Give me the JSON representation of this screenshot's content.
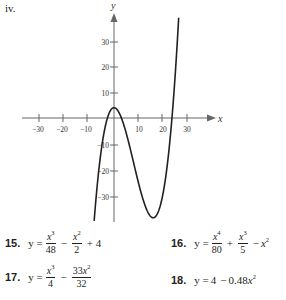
{
  "panel_label": "iv.",
  "chart_data": {
    "type": "line",
    "title": "",
    "xlabel": "x",
    "ylabel": "y",
    "x_ticks": [
      -30,
      -20,
      -10,
      10,
      20,
      30
    ],
    "y_ticks": [
      -30,
      -20,
      -10,
      10,
      20,
      30
    ],
    "x_tick_labels": [
      "−30",
      "−20",
      "−10",
      "10",
      "20",
      "30"
    ],
    "y_tick_labels": [
      "30",
      "20",
      "10",
      "−10",
      "−20",
      "−30"
    ],
    "xlim": [
      -36,
      36
    ],
    "ylim": [
      -38,
      40
    ],
    "grid": false,
    "series": [
      {
        "name": "curve",
        "function": "y = x^3/48 - x^2/2 + 4",
        "key_points": {
          "local_max": [
            0,
            4
          ],
          "local_min": [
            16,
            -38.7
          ],
          "x_intercepts": [
            -2.7,
            3.1,
            23.7
          ]
        }
      }
    ]
  },
  "axis": {
    "x_name": "x",
    "y_name": "y"
  },
  "exercises": [
    {
      "number": "15.",
      "lhs": "y =",
      "parts": [
        "x3/48",
        "x2/2",
        "+ 4"
      ]
    },
    {
      "number": "16.",
      "lhs": "y =",
      "parts": [
        "x4/80",
        "x3/5",
        "− x2"
      ]
    },
    {
      "number": "17.",
      "lhs": "y =",
      "parts": [
        "x3/4",
        "33x2/32"
      ]
    },
    {
      "number": "18.",
      "lhs": "y =",
      "expr": "4 − 0.48x2"
    }
  ],
  "text": {
    "n15": "15.",
    "n16": "16.",
    "n17": "17.",
    "n18": "18.",
    "y_eq": "y =",
    "e15_n1": "48",
    "e15_d2": "2",
    "e15_tail": "+ 4",
    "e16_d1": "80",
    "e16_d2": "5",
    "e17_d1": "4",
    "e17_n2": "33",
    "e17_d2": "32",
    "e18_const": "4",
    "e18_coef": "0.48",
    "minus": "−",
    "plus": "+"
  }
}
